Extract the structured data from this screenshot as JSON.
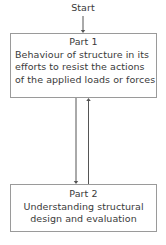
{
  "diagram": {
    "type": "flowchart",
    "orientation": "vertical",
    "background_color": "#ffffff",
    "border_color": "#9a9a9a",
    "text_color": "#3a3a3a",
    "arrow_color": "#555555",
    "start": {
      "label": "Start"
    },
    "nodes": [
      {
        "id": "part1",
        "title": "Part 1",
        "body_lines": [
          "Behaviour of structure in its",
          "efforts to resist the actions",
          "of the applied loads or forces"
        ]
      },
      {
        "id": "part2",
        "title": "Part 2",
        "body_lines": [
          "Understanding structural",
          "design and evaluation"
        ]
      }
    ],
    "connectors": [
      {
        "id": "start-to-part1",
        "from": "start",
        "to": "part1",
        "direction": "down"
      },
      {
        "id": "part1-to-part2",
        "from": "part1",
        "to": "part2",
        "direction": "down"
      },
      {
        "id": "part2-to-part1",
        "from": "part2",
        "to": "part1",
        "direction": "up"
      }
    ]
  }
}
